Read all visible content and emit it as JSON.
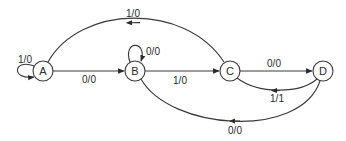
{
  "diagram": {
    "type": "state-machine",
    "nodes": [
      {
        "id": "A",
        "label": "A"
      },
      {
        "id": "B",
        "label": "B"
      },
      {
        "id": "C",
        "label": "C"
      },
      {
        "id": "D",
        "label": "D"
      }
    ],
    "edges": [
      {
        "from": "A",
        "to": "A",
        "label": "1/0"
      },
      {
        "from": "A",
        "to": "B",
        "label": "0/0"
      },
      {
        "from": "B",
        "to": "B",
        "label": "0/0"
      },
      {
        "from": "B",
        "to": "C",
        "label": "1/0"
      },
      {
        "from": "C",
        "to": "A",
        "label": "1/0"
      },
      {
        "from": "C",
        "to": "D",
        "label": "0/0"
      },
      {
        "from": "D",
        "to": "C",
        "label": "1/1"
      },
      {
        "from": "D",
        "to": "B",
        "label": "0/0"
      }
    ]
  }
}
